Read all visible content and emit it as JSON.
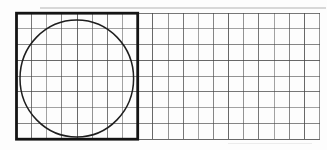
{
  "figure": {
    "background_color": "#fdfdfd",
    "canvas": {
      "width": 327,
      "height": 150
    },
    "grid": {
      "columns": 20,
      "rows": 8,
      "left": 16.5,
      "top": 13.2,
      "right": 319.5,
      "bottom": 139.2,
      "line_color": "#474747",
      "line_width": 1
    },
    "square": {
      "left": 16.5,
      "top": 13.2,
      "right": 137.7,
      "bottom": 139.2,
      "cells_wide": 8,
      "cells_tall": 8,
      "stroke_color": "#141414",
      "stroke_width": 2.8
    },
    "circle": {
      "cx": 76.8,
      "cy": 78.5,
      "rx": 56.8,
      "ry": 58.5,
      "stroke_color": "#1e1e1e",
      "stroke_width": 1.5
    },
    "scan_artifacts": [
      {
        "y": 8,
        "x1": 40,
        "x2": 326,
        "color": "#c0c0c0",
        "width": 1.3,
        "opacity": 0.6
      },
      {
        "y": 143.5,
        "x1": 228,
        "x2": 312,
        "color": "#cccccc",
        "width": 1.2,
        "opacity": 0.35
      }
    ]
  }
}
